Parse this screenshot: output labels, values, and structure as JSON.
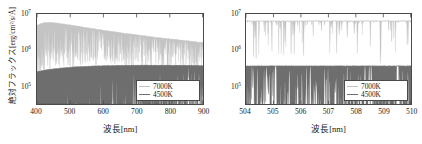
{
  "figure": {
    "panels": [
      {
        "id": "left",
        "name": "full-range-spectrum",
        "xlabel": "波長[nm]",
        "ylabel": "絶対フラックス[erg/cm²/s/Å]",
        "xticks": [
          "400",
          "500",
          "600",
          "700",
          "800",
          "900"
        ],
        "yticks": [
          "10",
          "10",
          "10"
        ],
        "yexps": [
          "7",
          "6",
          "5"
        ],
        "legend": [
          {
            "label": "7000K",
            "color": "#c4c4c4"
          },
          {
            "label": "4500K",
            "color": "#6e6e6e"
          }
        ]
      },
      {
        "id": "right",
        "name": "zoomed-spectrum",
        "xlabel": "波長[nm]",
        "ylabel": "",
        "xticks": [
          "504",
          "505",
          "506",
          "507",
          "508",
          "509",
          "510"
        ],
        "yticks": [
          "10",
          "10",
          "10"
        ],
        "yexps": [
          "7",
          "6",
          "5"
        ],
        "legend": [
          {
            "label": "7000K",
            "color": "#c4c4c4"
          },
          {
            "label": "4500K",
            "color": "#6e6e6e"
          }
        ]
      }
    ]
  },
  "chart_data": [
    {
      "type": "line",
      "id": "left-panel",
      "title": "",
      "xlabel": "波長[nm]",
      "ylabel": "絶対フラックス[erg/cm²/s/Å]",
      "xlim": [
        400,
        900
      ],
      "ylim": [
        100000,
        10000000
      ],
      "yscale": "log",
      "xscale": "linear",
      "grid": false,
      "legend_position": "lower-right",
      "xticks": [
        400,
        500,
        600,
        700,
        800,
        900
      ],
      "yticks": [
        100000,
        1000000,
        10000000
      ],
      "series": [
        {
          "name": "7000K",
          "color": "#c4c4c4",
          "description": "Upper light-grey absorption-line forest; continuum peaks near 6.5e6 around 430 nm then declines monotonically toward 2.2e6 at 900 nm. Dense downward absorption spikes reaching 2e6-3e6 below the continuum, densest blueward of 600 nm.",
          "x": [
            400,
            420,
            440,
            460,
            480,
            500,
            520,
            540,
            560,
            580,
            600,
            620,
            640,
            660,
            680,
            700,
            720,
            740,
            760,
            780,
            800,
            820,
            840,
            860,
            880,
            900
          ],
          "values": [
            5600000,
            6400000,
            6500000,
            6300000,
            6000000,
            5700000,
            5400000,
            5100000,
            4850000,
            4600000,
            4350000,
            4150000,
            3950000,
            3750000,
            3600000,
            3450000,
            3300000,
            3150000,
            3000000,
            2900000,
            2800000,
            2700000,
            2600000,
            2500000,
            2400000,
            2300000
          ]
        },
        {
          "name": "4500K",
          "color": "#6e6e6e",
          "description": "Lower dark-grey absorption-line forest; continuum rises from about 5.2e5 at 400 nm to a plateau near 7.2e5 beyond 600 nm. Deep absorption troughs extend down below 1e5 at short wavelengths, shallowing toward the red.",
          "x": [
            400,
            420,
            440,
            460,
            480,
            500,
            520,
            540,
            560,
            580,
            600,
            620,
            640,
            660,
            680,
            700,
            720,
            740,
            760,
            780,
            800,
            820,
            840,
            860,
            880,
            900
          ],
          "values": [
            520000,
            560000,
            590000,
            615000,
            635000,
            655000,
            670000,
            682000,
            692000,
            700000,
            708000,
            714000,
            718000,
            722000,
            724000,
            726000,
            727000,
            728000,
            728000,
            727000,
            726000,
            724000,
            722000,
            719000,
            716000,
            712000
          ]
        }
      ]
    },
    {
      "type": "line",
      "id": "right-panel",
      "title": "",
      "xlabel": "波長[nm]",
      "ylabel": "",
      "xlim": [
        504,
        510
      ],
      "ylim": [
        100000,
        10000000
      ],
      "yscale": "log",
      "xscale": "linear",
      "grid": false,
      "legend_position": "lower-right",
      "xticks": [
        504,
        505,
        506,
        507,
        508,
        509,
        510
      ],
      "yticks": [
        100000,
        1000000,
        10000000
      ],
      "series": [
        {
          "name": "7000K",
          "color": "#c4c4c4",
          "description": "Near-flat continuum at about 7e6 across 504-510 nm, punctuated by narrow absorption lines dropping to 3e6-5e6; a few deeper lines reach 2e6.",
          "x": [
            504,
            505,
            506,
            507,
            508,
            509,
            510
          ],
          "values": [
            7000000,
            7000000,
            7000000,
            7000000,
            7000000,
            7000000,
            7000000
          ]
        },
        {
          "name": "4500K",
          "color": "#6e6e6e",
          "description": "Continuum near 7e5 with a crowded forest of strong absorption lines; typical line cores reach 2e5-4e5 and the strongest cores dip below 1e5.",
          "x": [
            504,
            505,
            506,
            507,
            508,
            509,
            510
          ],
          "values": [
            700000,
            700000,
            700000,
            700000,
            700000,
            700000,
            700000
          ]
        }
      ]
    }
  ]
}
